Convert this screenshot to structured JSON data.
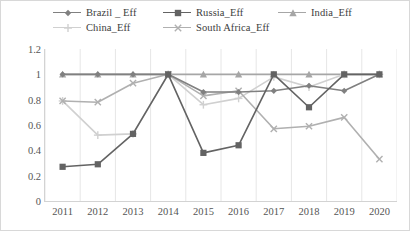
{
  "chart_data": {
    "type": "line",
    "title": "",
    "subtitle": "",
    "xlabel": "",
    "ylabel": "",
    "categories": [
      "2011",
      "2012",
      "2013",
      "2014",
      "2015",
      "2016",
      "2017",
      "2018",
      "2019",
      "2020"
    ],
    "x": [
      2011,
      2012,
      2013,
      2014,
      2015,
      2016,
      2017,
      2018,
      2019,
      2020
    ],
    "ylim": [
      0,
      1.2
    ],
    "yticks": [
      "0",
      "0.2",
      "0.4",
      "0.6",
      "0.8",
      "1",
      "1.2"
    ],
    "ytick_values": [
      0,
      0.2,
      0.4,
      0.6,
      0.8,
      1,
      1.2
    ],
    "grid": "vertical-only",
    "legend_position": "top",
    "series": [
      {
        "name": "Brazil _ Eff",
        "marker": "diamond",
        "color": "#808080",
        "values": [
          1.0,
          1.0,
          1.0,
          1.0,
          0.86,
          0.86,
          0.87,
          0.91,
          0.87,
          1.0
        ]
      },
      {
        "name": "Russia_Eff",
        "marker": "square",
        "color": "#636363",
        "values": [
          0.27,
          0.29,
          0.53,
          1.0,
          0.38,
          0.44,
          1.0,
          0.74,
          1.0,
          1.0
        ]
      },
      {
        "name": "India_Eff",
        "marker": "triangle",
        "color": "#a6a6a6",
        "values": [
          1.0,
          1.0,
          1.0,
          1.0,
          1.0,
          1.0,
          1.0,
          1.0,
          1.0,
          1.0
        ]
      },
      {
        "name": "China_Eff",
        "marker": "plus",
        "color": "#d0d0d0",
        "values": [
          0.79,
          0.52,
          0.53,
          1.0,
          0.76,
          0.81,
          0.98,
          0.9,
          1.0,
          1.0
        ]
      },
      {
        "name": "South Africa_Eff",
        "marker": "cross",
        "color": "#b0b0b0",
        "values": [
          0.79,
          0.78,
          0.93,
          1.0,
          0.83,
          0.87,
          0.57,
          0.59,
          0.66,
          0.33
        ]
      }
    ]
  },
  "legend": {
    "rows": [
      [
        {
          "label": "Brazil _ Eff",
          "marker": "diamond-marker-icon",
          "color": "#808080"
        },
        {
          "label": "Russia_Eff",
          "marker": "square-marker-icon",
          "color": "#636363"
        },
        {
          "label": "India_Eff",
          "marker": "triangle-marker-icon",
          "color": "#a6a6a6"
        }
      ],
      [
        {
          "label": "China_Eff",
          "marker": "plus-marker-icon",
          "color": "#d0d0d0"
        },
        {
          "label": "South Africa_Eff",
          "marker": "cross-marker-icon",
          "color": "#b0b0b0"
        }
      ]
    ]
  },
  "axes": {
    "y_ticks": [
      "1.2",
      "1",
      "0.8",
      "0.6",
      "0.4",
      "0.2",
      "0"
    ],
    "x_ticks": [
      "2011",
      "2012",
      "2013",
      "2014",
      "2015",
      "2016",
      "2017",
      "2018",
      "2019",
      "2020"
    ]
  },
  "colors": {
    "grid": "#e6e6e6",
    "axis": "#d3d3d3",
    "text": "#555555",
    "background": "#ffffff",
    "border": "#d8d8d8"
  }
}
